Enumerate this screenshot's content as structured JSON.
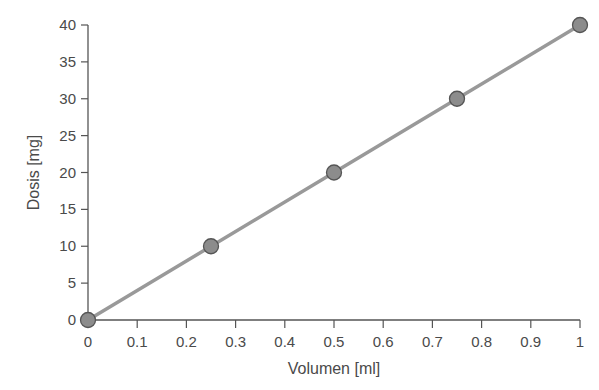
{
  "chart_data": {
    "type": "line",
    "title": "",
    "xlabel": "Volumen [ml]",
    "ylabel": "Dosis [mg]",
    "x": [
      0,
      0.25,
      0.5,
      0.75,
      1
    ],
    "series": [
      {
        "name": "Dosis",
        "values": [
          0,
          10,
          20,
          30,
          40
        ]
      }
    ],
    "xlim": [
      0,
      1
    ],
    "ylim": [
      0,
      40
    ],
    "xticks": [
      "0",
      "0.1",
      "0.2",
      "0.3",
      "0.4",
      "0.5",
      "0.6",
      "0.7",
      "0.8",
      "0.9",
      "1"
    ],
    "yticks": [
      "0",
      "5",
      "10",
      "15",
      "20",
      "25",
      "30",
      "35",
      "40"
    ],
    "grid": false,
    "legend": "none",
    "colors": {
      "line": "#999999",
      "marker_fill": "#8c8c8c",
      "marker_edge": "#555555",
      "axis": "#555555"
    }
  }
}
